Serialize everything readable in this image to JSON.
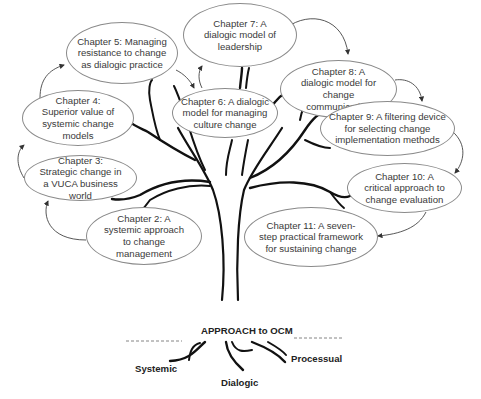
{
  "diagram": {
    "type": "tree-of-chapters",
    "root_label": "APPROACH to OCM",
    "roots": [
      {
        "label": "Systemic"
      },
      {
        "label": "Dialogic"
      },
      {
        "label": "Processual"
      }
    ],
    "chapters": [
      {
        "id": "ch2",
        "text": "Chapter 2: A systemic approach to change management"
      },
      {
        "id": "ch3",
        "text": "Chapter 3: Strategic change in a VUCA business world"
      },
      {
        "id": "ch4",
        "text": "Chapter 4: Superior value of systemic change models"
      },
      {
        "id": "ch5",
        "text": "Chapter 5: Managing resistance to change as dialogic practice"
      },
      {
        "id": "ch6",
        "text": "Chapter 6: A dialogic model for managing culture change"
      },
      {
        "id": "ch7",
        "text": "Chapter 7: A dialogic model of leadership"
      },
      {
        "id": "ch8",
        "text": "Chapter 8: A dialogic model for change communication"
      },
      {
        "id": "ch9",
        "text": "Chapter 9: A filtering device for selecting change implementation methods"
      },
      {
        "id": "ch10",
        "text": "Chapter 10: A critical approach to change evaluation"
      },
      {
        "id": "ch11",
        "text": "Chapter 11: A seven-step practical framework for sustaining change"
      }
    ],
    "sequence_arrows": [
      [
        "ch2",
        "ch3"
      ],
      [
        "ch3",
        "ch4"
      ],
      [
        "ch4",
        "ch5"
      ],
      [
        "ch5",
        "ch6"
      ],
      [
        "ch6",
        "ch7"
      ],
      [
        "ch7",
        "ch8"
      ],
      [
        "ch8",
        "ch9"
      ],
      [
        "ch9",
        "ch10"
      ],
      [
        "ch10",
        "ch11"
      ]
    ],
    "colors": {
      "stroke": "#111111",
      "ellipse_border": "#8a8a8a",
      "text": "#3a3a3a",
      "background": "#ffffff"
    }
  }
}
